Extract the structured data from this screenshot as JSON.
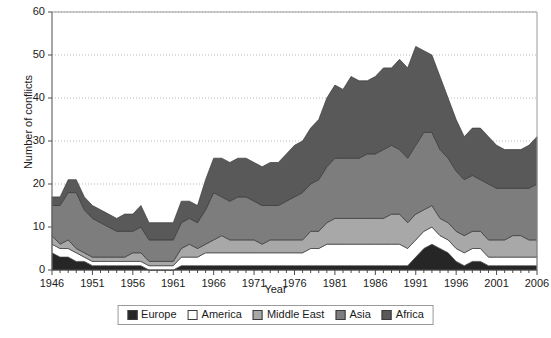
{
  "chart_data": {
    "type": "area",
    "stacked": true,
    "title": "",
    "xlabel": "Year",
    "ylabel": "Number of conflicts",
    "xlim": [
      1946,
      2006
    ],
    "ylim": [
      0,
      60
    ],
    "yticks": [
      0,
      10,
      20,
      30,
      40,
      50,
      60
    ],
    "xticks": [
      1946,
      1951,
      1956,
      1961,
      1966,
      1971,
      1976,
      1981,
      1986,
      1991,
      1996,
      2001,
      2006
    ],
    "grid": "horizontal",
    "legend_position": "bottom",
    "x": [
      1946,
      1947,
      1948,
      1949,
      1950,
      1951,
      1952,
      1953,
      1954,
      1955,
      1956,
      1957,
      1958,
      1959,
      1960,
      1961,
      1962,
      1963,
      1964,
      1965,
      1966,
      1967,
      1968,
      1969,
      1970,
      1971,
      1972,
      1973,
      1974,
      1975,
      1976,
      1977,
      1978,
      1979,
      1980,
      1981,
      1982,
      1983,
      1984,
      1985,
      1986,
      1987,
      1988,
      1989,
      1990,
      1991,
      1992,
      1993,
      1994,
      1995,
      1996,
      1997,
      1998,
      1999,
      2000,
      2001,
      2002,
      2003,
      2004,
      2005,
      2006
    ],
    "series": [
      {
        "name": "Europe",
        "color": "#262626",
        "values": [
          4,
          3,
          3,
          2,
          2,
          1,
          1,
          1,
          1,
          1,
          1,
          1,
          0,
          0,
          0,
          0,
          1,
          1,
          1,
          1,
          1,
          1,
          1,
          1,
          1,
          1,
          1,
          1,
          1,
          1,
          1,
          1,
          1,
          1,
          1,
          1,
          1,
          1,
          1,
          1,
          1,
          1,
          1,
          1,
          1,
          3,
          5,
          6,
          5,
          4,
          2,
          1,
          2,
          2,
          1,
          1,
          1,
          1,
          1,
          1,
          1
        ]
      },
      {
        "name": "America",
        "color": "#ffffff",
        "values": [
          2,
          2,
          2,
          2,
          1,
          1,
          1,
          1,
          1,
          1,
          1,
          1,
          1,
          1,
          1,
          1,
          2,
          2,
          2,
          3,
          3,
          3,
          3,
          3,
          3,
          3,
          3,
          3,
          3,
          3,
          3,
          3,
          4,
          4,
          5,
          5,
          5,
          5,
          5,
          5,
          5,
          5,
          5,
          5,
          4,
          4,
          4,
          4,
          3,
          3,
          3,
          3,
          3,
          3,
          2,
          2,
          2,
          2,
          2,
          2,
          2
        ]
      },
      {
        "name": "Middle East",
        "color": "#a8a8a8",
        "values": [
          2,
          1,
          2,
          1,
          1,
          1,
          1,
          1,
          1,
          1,
          2,
          2,
          1,
          1,
          1,
          1,
          2,
          3,
          2,
          2,
          3,
          4,
          3,
          3,
          3,
          3,
          2,
          3,
          3,
          3,
          3,
          3,
          4,
          4,
          5,
          6,
          6,
          6,
          6,
          6,
          6,
          6,
          7,
          7,
          6,
          6,
          5,
          5,
          4,
          4,
          4,
          4,
          4,
          4,
          4,
          4,
          4,
          5,
          5,
          4,
          4
        ]
      },
      {
        "name": "Asia",
        "color": "#7d7d7d",
        "values": [
          7,
          9,
          11,
          13,
          10,
          9,
          8,
          7,
          6,
          6,
          5,
          6,
          5,
          5,
          5,
          5,
          6,
          6,
          6,
          8,
          11,
          9,
          9,
          10,
          10,
          9,
          9,
          8,
          8,
          9,
          10,
          11,
          11,
          12,
          13,
          14,
          14,
          14,
          14,
          15,
          15,
          16,
          16,
          15,
          15,
          16,
          18,
          17,
          16,
          15,
          14,
          13,
          13,
          12,
          13,
          12,
          12,
          11,
          11,
          12,
          13
        ]
      },
      {
        "name": "Africa",
        "color": "#595959",
        "values": [
          2,
          2,
          3,
          3,
          3,
          3,
          3,
          3,
          3,
          4,
          4,
          5,
          4,
          4,
          4,
          4,
          5,
          4,
          4,
          7,
          8,
          9,
          9,
          9,
          9,
          9,
          9,
          10,
          10,
          11,
          12,
          12,
          13,
          14,
          16,
          17,
          16,
          19,
          18,
          17,
          18,
          19,
          18,
          21,
          21,
          23,
          19,
          18,
          17,
          14,
          12,
          10,
          11,
          12,
          11,
          10,
          9,
          9,
          9,
          10,
          11
        ]
      }
    ]
  },
  "legend": {
    "items": [
      {
        "label": "Europe",
        "color": "#262626"
      },
      {
        "label": "America",
        "color": "#ffffff"
      },
      {
        "label": "Middle East",
        "color": "#a8a8a8"
      },
      {
        "label": "Asia",
        "color": "#7d7d7d"
      },
      {
        "label": "Africa",
        "color": "#595959"
      }
    ]
  }
}
